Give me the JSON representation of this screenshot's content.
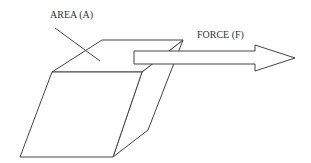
{
  "diagram": {
    "labels": {
      "area": "AREA (A)",
      "force": "FORCE (F)"
    },
    "stroke_color": "#444444"
  }
}
